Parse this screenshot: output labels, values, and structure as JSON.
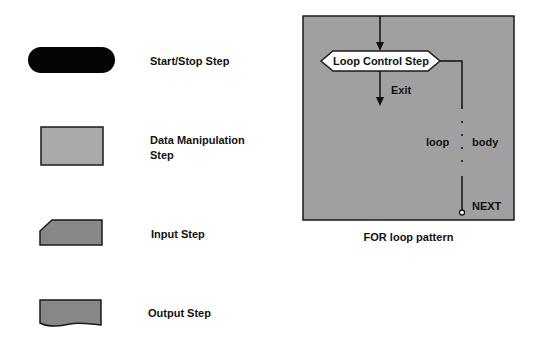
{
  "legend": {
    "items": [
      {
        "shape": "start-stop-terminal",
        "label": "Start/Stop Step",
        "fill": "#050505"
      },
      {
        "shape": "data-manipulation-rectangle",
        "label_line1": "Data Manipulation",
        "label_line2": "Step",
        "fill": "#a9a9a9"
      },
      {
        "shape": "input-chamfered",
        "label": "Input Step",
        "fill": "#888888"
      },
      {
        "shape": "output-wavy",
        "label": "Output Step",
        "fill": "#888888"
      }
    ]
  },
  "for_loop": {
    "panel_fill": "#a0a0a0",
    "loop_control_label": "Loop Control Step",
    "exit_label": "Exit",
    "loop_label": "loop",
    "body_label": "body",
    "next_label": "NEXT",
    "caption": "FOR loop pattern"
  }
}
